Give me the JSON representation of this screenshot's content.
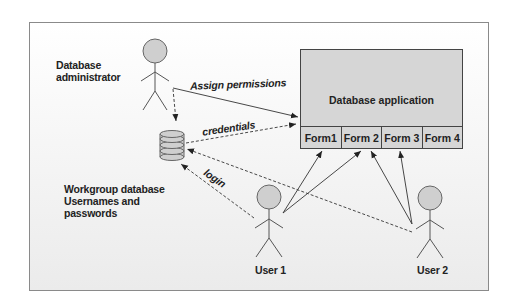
{
  "diagram": {
    "labels": {
      "admin_line1": "Database",
      "admin_line2": "administrator",
      "workgroup_line1": "Workgroup database",
      "workgroup_line2": "Usernames and",
      "workgroup_line3": "passwords",
      "user1": "User 1",
      "user2": "User 2"
    },
    "edges": {
      "assign_permissions": "Assign permissions",
      "credentials": "credentials",
      "login": "login"
    },
    "app": {
      "title": "Database application",
      "forms": [
        "Form1",
        "Form 2",
        "Form 3",
        "Form 4"
      ]
    },
    "colors": {
      "box_fill": "#d6d6d6",
      "head_fill": "#cfcfcf",
      "line": "#333333"
    }
  }
}
